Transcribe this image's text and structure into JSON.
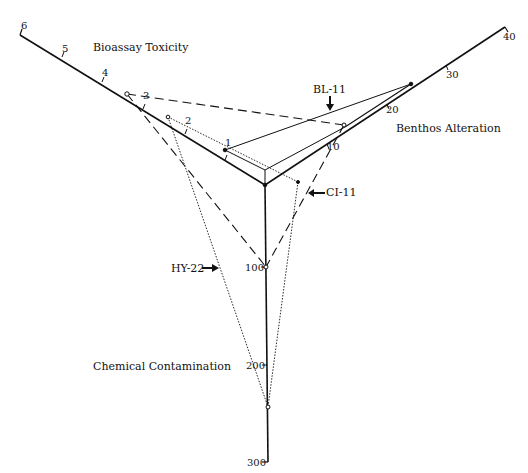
{
  "diagram": {
    "type": "triaxial-plot",
    "axes": [
      {
        "name": "Bioassay Toxicity",
        "ticks": [
          "1",
          "2",
          "3",
          "4",
          "5",
          "6"
        ]
      },
      {
        "name": "Benthos Alteration",
        "ticks": [
          "10",
          "20",
          "30",
          "40"
        ]
      },
      {
        "name": "Chemical Contamination",
        "ticks": [
          "100",
          "200",
          "300"
        ]
      }
    ],
    "labels": {
      "bioassay": "Bioassay Toxicity",
      "benthos": "Benthos Alteration",
      "chemical": "Chemical Contamination"
    },
    "stations": [
      {
        "name": "BL-11",
        "style": "solid"
      },
      {
        "name": "CI-11",
        "style": "dashed"
      },
      {
        "name": "HY-22",
        "style": "dotted"
      }
    ],
    "ticks": {
      "b1": "1",
      "b2": "2",
      "b3": "3",
      "b4": "4",
      "b5": "5",
      "b6": "6",
      "t10": "10",
      "t20": "20",
      "t30": "30",
      "t40": "40",
      "c100": "100",
      "c200": "200",
      "c300": "300"
    }
  }
}
